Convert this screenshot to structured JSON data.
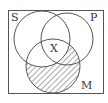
{
  "diagram": {
    "type": "venn",
    "sets": [
      {
        "name": "S",
        "label": "S"
      },
      {
        "name": "P",
        "label": "P"
      },
      {
        "name": "M",
        "label": "M"
      }
    ],
    "marks": [
      {
        "region": "S∩P∩M",
        "symbol": "X"
      }
    ],
    "shaded_region": "M − S",
    "colors": {
      "stroke": "#555555",
      "hatch": "#555555",
      "background": "#ffffff"
    }
  }
}
